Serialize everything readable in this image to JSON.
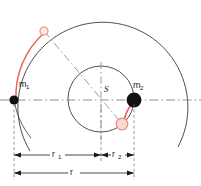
{
  "figure": {
    "center_label": "S",
    "bodies": [
      {
        "id": "m1",
        "label": "m",
        "subscript": "1",
        "cx": 14,
        "cy": 100,
        "r": 4.6,
        "color": "#111111"
      },
      {
        "id": "m2",
        "label": "m",
        "subscript": "2",
        "cx": 134,
        "cy": 100,
        "r": 7.4,
        "color": "#111111"
      }
    ],
    "ghost_bodies": [
      {
        "id": "m1-ghost",
        "cx": 44,
        "cy": 31,
        "r": 4.2,
        "stroke": "#e98a80",
        "fill": "#f9ded9"
      },
      {
        "id": "m2-ghost",
        "cx": 122,
        "cy": 124,
        "r": 6.0,
        "stroke": "#e98a80",
        "fill": "#f7d6cf"
      }
    ],
    "orbits": [
      {
        "id": "outer-orbit",
        "cx": 101,
        "cy": 99,
        "r": 85,
        "color": "#3a3a3a"
      },
      {
        "id": "inner-orbit",
        "cx": 101,
        "cy": 99,
        "r": 33,
        "color": "#3a3a3a"
      }
    ],
    "trails": [
      {
        "id": "m1-trail",
        "color": "#ed6458"
      },
      {
        "id": "m2-trail",
        "color": "#ed6458"
      }
    ],
    "axis_color": "#8a8a8a",
    "dimension_color": "#1a1a1a",
    "dimensions": [
      {
        "id": "r1",
        "label": "r",
        "subscript": "1",
        "from_x": 14,
        "to_x": 101,
        "y": 155
      },
      {
        "id": "r2",
        "label": "r",
        "subscript": "2",
        "from_x": 101,
        "to_x": 134,
        "y": 155
      },
      {
        "id": "r",
        "label": "r",
        "subscript": "",
        "from_x": 14,
        "to_x": 134,
        "y": 173
      }
    ]
  }
}
